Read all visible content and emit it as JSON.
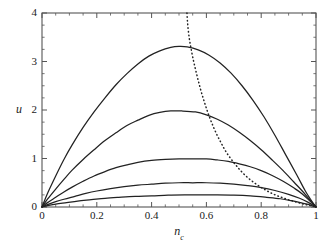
{
  "chart_data": {
    "type": "line",
    "title": "",
    "subtitle": "",
    "xlabel": "n_c",
    "ylabel": "u",
    "xlabel_base": "n",
    "xlabel_sub": "c",
    "xlim": [
      0,
      1
    ],
    "ylim": [
      0,
      4
    ],
    "xticks": [
      0,
      0.2,
      0.4,
      0.6,
      0.8,
      1
    ],
    "xtick_labels": [
      "0",
      "0.2",
      "0.4",
      "0.6",
      "0.8",
      "1"
    ],
    "yticks": [
      0,
      1,
      2,
      3,
      4
    ],
    "ytick_labels": [
      "0",
      "1",
      "2",
      "3",
      "4"
    ],
    "x_minor_ticks": [
      0.05,
      0.1,
      0.15,
      0.25,
      0.3,
      0.35,
      0.45,
      0.5,
      0.55,
      0.65,
      0.7,
      0.75,
      0.85,
      0.9,
      0.95
    ],
    "y_minor_ticks": [
      0.25,
      0.5,
      0.75,
      1.25,
      1.5,
      1.75,
      2.25,
      2.5,
      2.75,
      3.25,
      3.5,
      3.75
    ],
    "grid": false,
    "legend": "none",
    "frame": true,
    "line_color": "#222222",
    "axis_color": "#555555",
    "background": "#ffffff",
    "series": [
      {
        "name": "curve-1",
        "style": "solid",
        "peak_x": 0.53,
        "peak_y": 3.3,
        "x": [
          0.0,
          0.02,
          0.05,
          0.08,
          0.11,
          0.15,
          0.19,
          0.23,
          0.27,
          0.31,
          0.35,
          0.39,
          0.43,
          0.47,
          0.5,
          0.53,
          0.57,
          0.61,
          0.65,
          0.69,
          0.73,
          0.77,
          0.81,
          0.85,
          0.89,
          0.93,
          0.96,
          0.98,
          1.0
        ],
        "y": [
          0.0,
          0.28,
          0.64,
          0.98,
          1.28,
          1.64,
          1.96,
          2.25,
          2.52,
          2.75,
          2.95,
          3.11,
          3.22,
          3.29,
          3.31,
          3.3,
          3.24,
          3.13,
          2.97,
          2.76,
          2.5,
          2.2,
          1.86,
          1.48,
          1.07,
          0.66,
          0.34,
          0.16,
          0.0
        ]
      },
      {
        "name": "curve-2",
        "style": "solid",
        "peak_x": 0.56,
        "peak_y": 1.98,
        "x": [
          0.0,
          0.02,
          0.05,
          0.08,
          0.11,
          0.15,
          0.19,
          0.23,
          0.27,
          0.31,
          0.35,
          0.39,
          0.43,
          0.47,
          0.51,
          0.56,
          0.6,
          0.64,
          0.68,
          0.72,
          0.76,
          0.8,
          0.84,
          0.88,
          0.92,
          0.95,
          0.98,
          1.0
        ],
        "y": [
          0.0,
          0.16,
          0.37,
          0.57,
          0.76,
          0.98,
          1.18,
          1.37,
          1.53,
          1.68,
          1.79,
          1.89,
          1.95,
          1.98,
          1.98,
          1.96,
          1.9,
          1.81,
          1.69,
          1.54,
          1.37,
          1.18,
          0.97,
          0.75,
          0.51,
          0.33,
          0.13,
          0.0
        ]
      },
      {
        "name": "curve-3",
        "style": "solid",
        "peak_x": 0.6,
        "peak_y": 0.99,
        "x": [
          0.0,
          0.02,
          0.05,
          0.08,
          0.11,
          0.15,
          0.19,
          0.23,
          0.27,
          0.31,
          0.35,
          0.4,
          0.45,
          0.5,
          0.55,
          0.6,
          0.64,
          0.68,
          0.72,
          0.76,
          0.8,
          0.84,
          0.88,
          0.92,
          0.95,
          0.98,
          1.0
        ],
        "y": [
          0.0,
          0.09,
          0.2,
          0.31,
          0.41,
          0.53,
          0.64,
          0.73,
          0.81,
          0.87,
          0.92,
          0.96,
          0.98,
          0.99,
          0.99,
          0.99,
          0.97,
          0.94,
          0.89,
          0.83,
          0.75,
          0.65,
          0.53,
          0.39,
          0.27,
          0.11,
          0.0
        ]
      },
      {
        "name": "curve-4",
        "style": "solid",
        "peak_x": 0.63,
        "peak_y": 0.5,
        "x": [
          0.0,
          0.02,
          0.05,
          0.08,
          0.12,
          0.16,
          0.2,
          0.25,
          0.3,
          0.35,
          0.4,
          0.45,
          0.5,
          0.55,
          0.6,
          0.65,
          0.7,
          0.75,
          0.8,
          0.85,
          0.9,
          0.94,
          0.97,
          1.0
        ],
        "y": [
          0.0,
          0.05,
          0.11,
          0.16,
          0.22,
          0.28,
          0.33,
          0.38,
          0.42,
          0.45,
          0.47,
          0.49,
          0.5,
          0.5,
          0.5,
          0.49,
          0.47,
          0.44,
          0.4,
          0.34,
          0.26,
          0.18,
          0.1,
          0.0
        ]
      },
      {
        "name": "curve-5",
        "style": "solid",
        "peak_x": 0.66,
        "peak_y": 0.25,
        "x": [
          0.0,
          0.02,
          0.05,
          0.09,
          0.13,
          0.18,
          0.23,
          0.28,
          0.34,
          0.4,
          0.46,
          0.52,
          0.58,
          0.64,
          0.7,
          0.76,
          0.82,
          0.87,
          0.91,
          0.95,
          0.98,
          1.0
        ],
        "y": [
          0.0,
          0.03,
          0.06,
          0.09,
          0.12,
          0.15,
          0.18,
          0.2,
          0.22,
          0.23,
          0.245,
          0.25,
          0.25,
          0.25,
          0.245,
          0.23,
          0.2,
          0.17,
          0.13,
          0.08,
          0.04,
          0.0
        ]
      },
      {
        "name": "envelope-dotted",
        "style": "dotted",
        "x": [
          0.529,
          0.531,
          0.534,
          0.538,
          0.543,
          0.549,
          0.556,
          0.564,
          0.572,
          0.58,
          0.589,
          0.598,
          0.607,
          0.617,
          0.628,
          0.64,
          0.652,
          0.664,
          0.676,
          0.69,
          0.705,
          0.72,
          0.735,
          0.752,
          0.77,
          0.79,
          0.81,
          0.832,
          0.855,
          0.88,
          0.905,
          0.93,
          0.955,
          0.978,
          1.0
        ],
        "y": [
          4.0,
          3.82,
          3.64,
          3.46,
          3.3,
          3.12,
          2.94,
          2.75,
          2.57,
          2.4,
          2.23,
          2.07,
          1.92,
          1.77,
          1.62,
          1.47,
          1.34,
          1.21,
          1.1,
          0.99,
          0.88,
          0.78,
          0.69,
          0.6,
          0.52,
          0.44,
          0.37,
          0.3,
          0.24,
          0.19,
          0.14,
          0.1,
          0.06,
          0.03,
          0.0
        ]
      }
    ]
  },
  "axes_geometry": {
    "left_px": 42,
    "right_px": 316,
    "top_px": 13,
    "bottom_px": 207
  }
}
